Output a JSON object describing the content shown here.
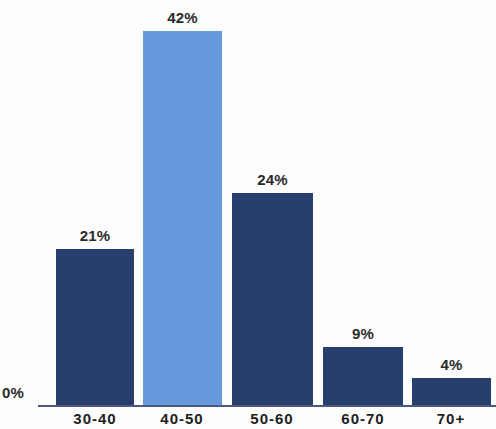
{
  "chart_data": {
    "type": "bar",
    "title": "",
    "xlabel": "",
    "ylabel": "",
    "categories": [
      "30-40",
      "40-50",
      "50-60",
      "60-70",
      "70+"
    ],
    "values": [
      21,
      42,
      24,
      9,
      4
    ],
    "value_labels": [
      "21%",
      "42%",
      "24%",
      "9%",
      "4%"
    ],
    "ylim": [
      0,
      50
    ],
    "grid": false,
    "legend": "none",
    "axis_labels": {
      "y_zero": "0%"
    },
    "highlight_index": 1,
    "colors": {
      "bar": "#283e6d",
      "bar_highlight": "#6699dd",
      "axis": "#4a5a80",
      "label_text": "#2a2a2a",
      "background": "#fdfdfd"
    }
  },
  "bars": [
    {
      "category": "30-40",
      "value": 21,
      "label": "21%",
      "left": 56,
      "width": 78,
      "height": 157,
      "highlight": false
    },
    {
      "category": "40-50",
      "value": 42,
      "label": "42%",
      "left": 143,
      "width": 79,
      "height": 375,
      "highlight": true
    },
    {
      "category": "50-60",
      "value": 24,
      "label": "24%",
      "left": 232,
      "width": 81,
      "height": 213,
      "highlight": false
    },
    {
      "category": "60-70",
      "value": 9,
      "label": "9%",
      "left": 323,
      "width": 80,
      "height": 59,
      "highlight": false
    },
    {
      "category": "70+",
      "value": 4,
      "label": "4%",
      "left": 412,
      "width": 79,
      "height": 28,
      "highlight": false
    }
  ],
  "category_axis": [
    {
      "label": "30-40",
      "center": 95
    },
    {
      "label": "40-50",
      "center": 182
    },
    {
      "label": "50-60",
      "center": 272
    },
    {
      "label": "60-70",
      "center": 363
    },
    {
      "label": "70+",
      "center": 451
    }
  ]
}
